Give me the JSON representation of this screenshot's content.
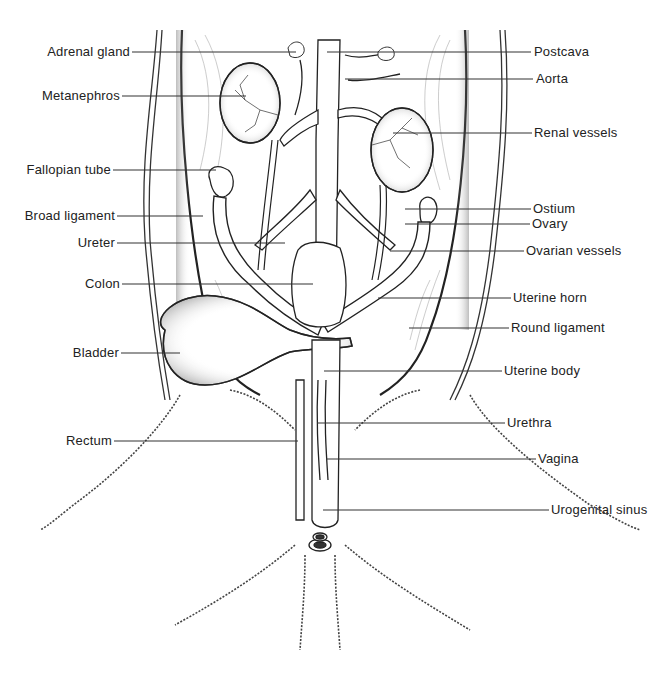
{
  "figure": {
    "colors": {
      "ink": "#222222",
      "background": "#ffffff"
    }
  },
  "labels_left": [
    {
      "id": "adrenal-gland",
      "text": "Adrenal gland",
      "x": 132,
      "y": 52,
      "line_to": 296
    },
    {
      "id": "metanephros",
      "text": "Metanephros",
      "x": 122,
      "y": 96,
      "line_to": 246
    },
    {
      "id": "fallopian-tube",
      "text": "Fallopian tube",
      "x": 113,
      "y": 170,
      "line_to": 216
    },
    {
      "id": "broad-ligament",
      "text": "Broad ligament",
      "x": 117,
      "y": 216,
      "line_to": 203
    },
    {
      "id": "ureter",
      "text": "Ureter",
      "x": 117,
      "y": 243,
      "line_to": 285
    },
    {
      "id": "colon",
      "text": "Colon",
      "x": 122,
      "y": 284,
      "line_to": 313
    },
    {
      "id": "bladder",
      "text": "Bladder",
      "x": 121,
      "y": 353,
      "line_to": 180
    },
    {
      "id": "rectum",
      "text": "Rectum",
      "x": 114,
      "y": 441,
      "line_to": 298
    }
  ],
  "labels_right": [
    {
      "id": "postcava",
      "text": "Postcava",
      "x": 531,
      "y": 52,
      "line_from": 327
    },
    {
      "id": "aorta",
      "text": "Aorta",
      "x": 533,
      "y": 79,
      "line_from": 345
    },
    {
      "id": "renal-vessels",
      "text": "Renal vessels",
      "x": 532,
      "y": 133,
      "line_from": 393
    },
    {
      "id": "ostium",
      "text": "Ostium",
      "x": 531,
      "y": 209,
      "line_from": 405
    },
    {
      "id": "ovary",
      "text": "Ovary",
      "x": 530,
      "y": 224,
      "line_from": 405
    },
    {
      "id": "ovarian-vessels",
      "text": "Ovarian vessels",
      "x": 524,
      "y": 251,
      "line_from": 390
    },
    {
      "id": "uterine-horn",
      "text": "Uterine horn",
      "x": 511,
      "y": 298,
      "line_from": 378
    },
    {
      "id": "round-ligament",
      "text": "Round ligament",
      "x": 509,
      "y": 328,
      "line_from": 409
    },
    {
      "id": "uterine-body",
      "text": "Uterine body",
      "x": 502,
      "y": 371,
      "line_from": 324
    },
    {
      "id": "urethra",
      "text": "Urethra",
      "x": 505,
      "y": 423,
      "line_from": 317
    },
    {
      "id": "vagina",
      "text": "Vagina",
      "x": 536,
      "y": 459,
      "line_from": 326
    },
    {
      "id": "urogenital-sinus",
      "text": "Urogenital sinus",
      "x": 549,
      "y": 510,
      "line_from": 323
    }
  ]
}
